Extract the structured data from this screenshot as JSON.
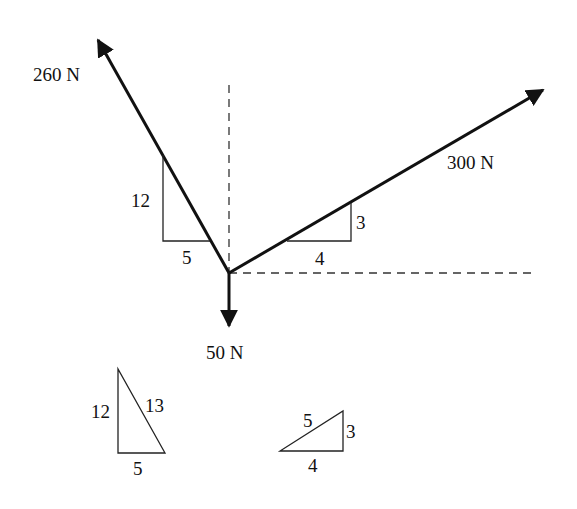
{
  "diagram": {
    "type": "free-body force diagram",
    "origin": [
      229,
      273
    ],
    "forces": [
      {
        "id": "f1",
        "label": "260 N",
        "magnitude": 260,
        "unit": "N",
        "direction": "up-left",
        "slope_rise": 12,
        "slope_run": 5
      },
      {
        "id": "f2",
        "label": "300 N",
        "magnitude": 300,
        "unit": "N",
        "direction": "up-right",
        "slope_rise": 3,
        "slope_run": 4
      },
      {
        "id": "f3",
        "label": "50 N",
        "magnitude": 50,
        "unit": "N",
        "direction": "down"
      }
    ],
    "slope_triangles": {
      "f1": {
        "vertical": "12",
        "horizontal": "5"
      },
      "f2": {
        "vertical": "3",
        "horizontal": "4"
      }
    },
    "reference_triangles": [
      {
        "id": "tri-5-12-13",
        "legs": [
          "12",
          "5"
        ],
        "hypotenuse": "13"
      },
      {
        "id": "tri-3-4-5",
        "legs": [
          "3",
          "4"
        ],
        "hypotenuse": "5"
      }
    ],
    "axes": {
      "vertical_dashed": true,
      "horizontal_dashed": true
    }
  }
}
